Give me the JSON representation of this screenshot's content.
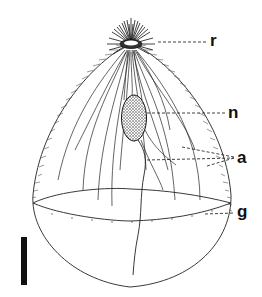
{
  "figure": {
    "colors": {
      "ink": "#111111",
      "background": "#ffffff"
    },
    "labels": [
      {
        "id": "r",
        "text": "r",
        "meaning": "apical structure (rostrum)"
      },
      {
        "id": "n",
        "text": "n",
        "meaning": "nucleus"
      },
      {
        "id": "a",
        "text": "a",
        "meaning": "axial fibres"
      },
      {
        "id": "g",
        "text": "g",
        "meaning": "girdle"
      }
    ],
    "scale_bar": {
      "orientation": "vertical",
      "value_shown": ""
    }
  }
}
